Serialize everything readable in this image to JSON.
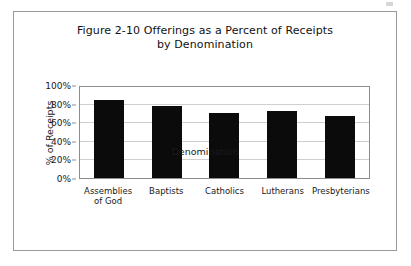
{
  "figure": {
    "title_line1": "Figure 2-10 Offerings as a Percent of Receipts",
    "title_line2": "by Denomination"
  },
  "colors": {
    "bar": "#0b0b0b",
    "gridline": "#cfcfcf",
    "plot_border": "#8d8d8d",
    "frame_border": "#9a9a9a",
    "text": "#1a1a1a"
  },
  "chart_data": {
    "type": "bar",
    "title": "Figure 2-10 Offerings as a Percent of Receipts by Denomination",
    "xlabel": "Denomination",
    "ylabel": "% of Receipts",
    "categories": [
      "Assemblies of God",
      "Baptists",
      "Catholics",
      "Lutherans",
      "Presbyterians"
    ],
    "category_lines": [
      [
        "Assemblies",
        "of God"
      ],
      [
        "Baptists"
      ],
      [
        "Catholics"
      ],
      [
        "Lutherans"
      ],
      [
        "Presbyterians"
      ]
    ],
    "values": [
      86,
      79,
      71,
      74,
      68
    ],
    "ylim": [
      0,
      100
    ],
    "ytick_values": [
      100,
      80,
      60,
      40,
      20,
      0
    ],
    "ytick_labels": [
      "100%",
      "80%",
      "60%",
      "40%",
      "20%",
      "0%"
    ],
    "grid": true,
    "legend": false,
    "legend_position": "none"
  }
}
